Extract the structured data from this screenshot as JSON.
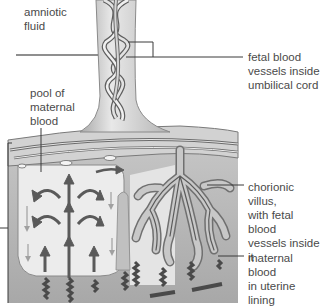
{
  "diagram": {
    "type": "anatomical-illustration",
    "labels": {
      "amniotic_fluid": "amniotic\nfluid",
      "pool_of_maternal_blood": "pool of\nmaternal\nblood",
      "fetal_blood_vessels": "fetal blood\nvessels inside\numbilical cord",
      "chorionic_villus": "chorionic villus,\nwith fetal blood\nvessels inside it",
      "maternal_blood_uterine": "maternal blood\nin uterine lining"
    },
    "colors": {
      "background": "#ffffff",
      "label_text": "#4a4a4a",
      "leader_line": "#3a3a3a",
      "vessel_fill": "#c8c8c8",
      "vessel_outline": "#6a6a6a",
      "uterine_tissue": "#b8b8b8",
      "pool_fill": "#ececec",
      "arrow": "#5a5a5a"
    }
  }
}
